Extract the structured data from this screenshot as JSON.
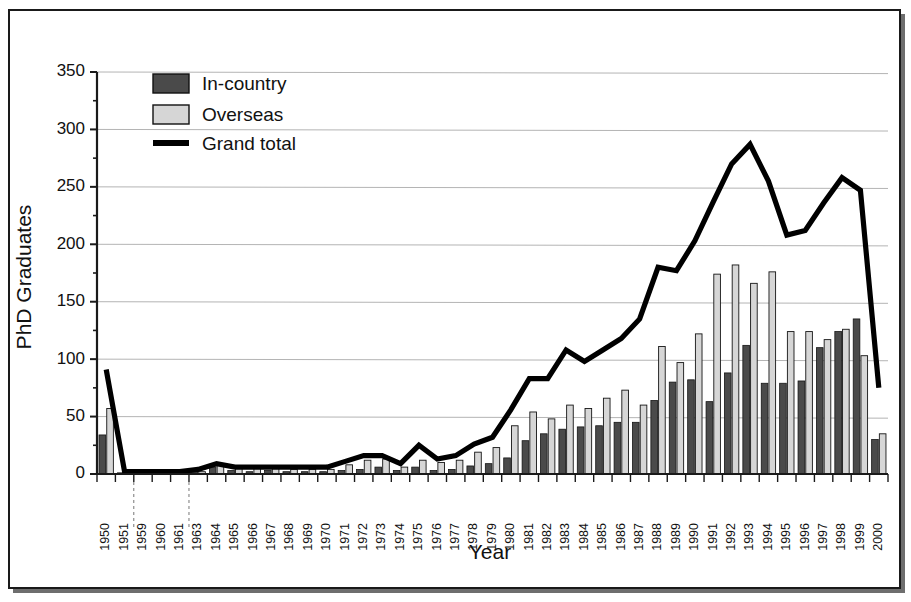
{
  "chart_data": {
    "type": "bar",
    "title": "",
    "xlabel": "Year",
    "ylabel": "PhD Graduates",
    "ylim": [
      0,
      350
    ],
    "ytick_step": 50,
    "yticks": [
      0,
      50,
      100,
      150,
      200,
      250,
      300,
      350
    ],
    "grid": true,
    "legend_position": "top-left",
    "legend": [
      "In-country",
      "Overseas",
      "Grand total"
    ],
    "colors": {
      "in_country": "#4a4a4a",
      "overseas": "#d6d6d6",
      "grand_total": "#000000",
      "gridline": "#b4b4b4",
      "axis": "#1a1a1a"
    },
    "categories": [
      "1950",
      "1951",
      "1959",
      "1960",
      "1961",
      "1963",
      "1964",
      "1965",
      "1966",
      "1967",
      "1968",
      "1969",
      "1970",
      "1971",
      "1972",
      "1973",
      "1974",
      "1975",
      "1976",
      "1977",
      "1978",
      "1979",
      "1980",
      "1981",
      "1982",
      "1983",
      "1984",
      "1985",
      "1986",
      "1987",
      "1988",
      "1989",
      "1990",
      "1991",
      "1992",
      "1993",
      "1994",
      "1995",
      "1996",
      "1997",
      "1998",
      "1999",
      "2000"
    ],
    "series": [
      {
        "name": "In-country",
        "type": "bar",
        "color": "#4a4a4a",
        "values": [
          34,
          1,
          1,
          1,
          1,
          2,
          6,
          3,
          2,
          3,
          2,
          2,
          2,
          3,
          4,
          6,
          3,
          6,
          3,
          4,
          7,
          9,
          14,
          29,
          35,
          39,
          41,
          42,
          45,
          45,
          64,
          80,
          82,
          63,
          88,
          112,
          79,
          79,
          81,
          110,
          124,
          135,
          30
        ]
      },
      {
        "name": "Overseas",
        "type": "bar",
        "color": "#d6d6d6",
        "values": [
          57,
          1,
          1,
          1,
          1,
          2,
          8,
          5,
          5,
          5,
          4,
          4,
          4,
          8,
          12,
          13,
          6,
          12,
          10,
          12,
          19,
          23,
          42,
          54,
          48,
          60,
          57,
          66,
          73,
          60,
          111,
          97,
          122,
          174,
          182,
          166,
          176,
          124,
          124,
          117,
          126,
          103,
          35
        ]
      },
      {
        "name": "Grand total",
        "type": "line",
        "color": "#000000",
        "values": [
          91,
          2,
          2,
          2,
          2,
          4,
          9,
          6,
          6,
          6,
          6,
          6,
          6,
          11,
          16,
          16,
          9,
          25,
          13,
          16,
          26,
          32,
          56,
          83,
          83,
          108,
          98,
          108,
          118,
          135,
          180,
          177,
          203,
          237,
          270,
          287,
          255,
          208,
          212,
          236,
          258,
          247,
          75
        ]
      }
    ]
  },
  "axis": {
    "y_label": "PhD Graduates",
    "x_label": "Year"
  },
  "legend": {
    "items": [
      {
        "label": "In-country",
        "swatch": "dark-gray-square",
        "marker": "bar"
      },
      {
        "label": "Overseas",
        "swatch": "light-gray-square",
        "marker": "bar"
      },
      {
        "label": "Grand total",
        "swatch": "black-line",
        "marker": "line"
      }
    ]
  }
}
